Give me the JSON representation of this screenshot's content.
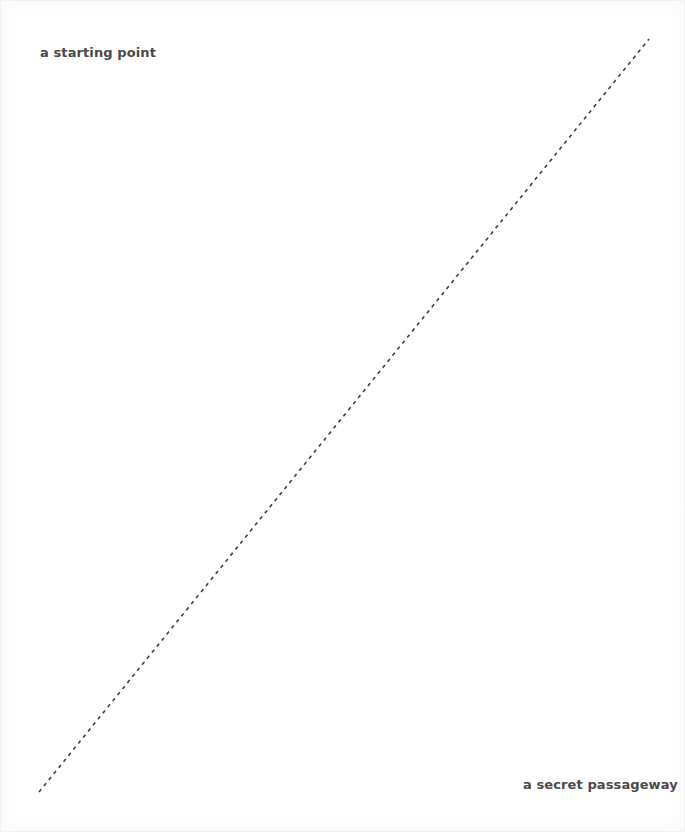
{
  "canvas": {
    "width": 685,
    "height": 832,
    "background_color": "#ffffff",
    "border_color": "#f2f2f2"
  },
  "labels": {
    "start": {
      "text": "a starting point",
      "color": "#4a4a4a",
      "position": "top-left"
    },
    "end": {
      "text": "a secret passageway",
      "color": "#4a4a4a",
      "position": "bottom-right"
    }
  },
  "chart_data": {
    "type": "line",
    "title": "",
    "subtitle": "",
    "xlabel": "",
    "ylabel": "",
    "grid": false,
    "legend": null,
    "style": {
      "stroke_color": "#3d3d4e",
      "stroke_width": 1.6,
      "dash_pattern": "3.6 4.2",
      "linecap": "butt"
    },
    "series": [
      {
        "name": "a secret passageway",
        "x": [
          38,
          648
        ],
        "y": [
          791,
          38
        ],
        "points": [
          {
            "x": 38,
            "y": 791
          },
          {
            "x": 648,
            "y": 38
          }
        ]
      }
    ],
    "annotations": [
      {
        "text": "a starting point",
        "x": 39,
        "y": 52,
        "anchor": "start"
      },
      {
        "text": "a secret passageway",
        "x": 522,
        "y": 788,
        "anchor": "start"
      }
    ],
    "xlim": [
      0,
      685
    ],
    "ylim": [
      832,
      0
    ]
  }
}
